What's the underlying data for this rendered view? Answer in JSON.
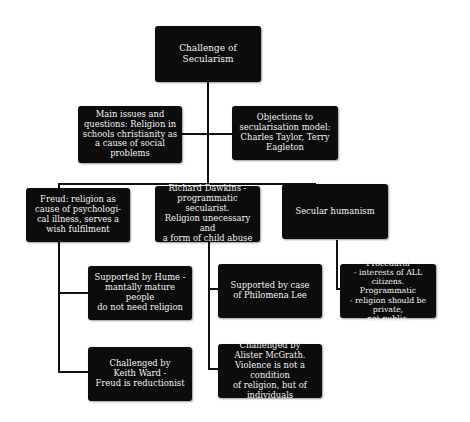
{
  "diagram": {
    "title": "Challenge of Secularism",
    "colors": {
      "node_fill": "#0c0c0c",
      "node_text": "#f2f2f2",
      "connector": "#111111",
      "background": "#ffffff"
    },
    "nodes": {
      "root": {
        "text": "Challenge of\nSecularism"
      },
      "issues": {
        "text": "Main issues and\nquestions: Religion in\nschools christianity as\na cause of social\nproblems"
      },
      "objections": {
        "text": "Objections to\nsecularisation model:\nCharles Taylor, Terry\nEagleton"
      },
      "freud": {
        "text": "Freud: religion as\ncause of psychologi-\ncal illness, serves a\nwish fulfilment"
      },
      "dawkins": {
        "text": "Richard Dawkins -\nprogrammatic secularist.\nReligion unecessary and\na form of child abuse"
      },
      "humanism": {
        "text": "Secular humanism"
      },
      "hume": {
        "text": "Supported by Hume -\nmantally mature people\ndo not need religion"
      },
      "philomena": {
        "text": "Supported by case\nof Philomena Lee"
      },
      "procedural": {
        "text": "Procedural\n- interests of ALL citizens.\nProgrammatic\n- religion should be private,\nnot public."
      },
      "ward": {
        "text": "Challenged by\nKeith Ward -\nFreud is reductionist"
      },
      "mcgrath": {
        "text": "Challenged by\nAlister McGrath.\nViolence is not a condition\nof religion, but of\nindividuals"
      }
    }
  }
}
